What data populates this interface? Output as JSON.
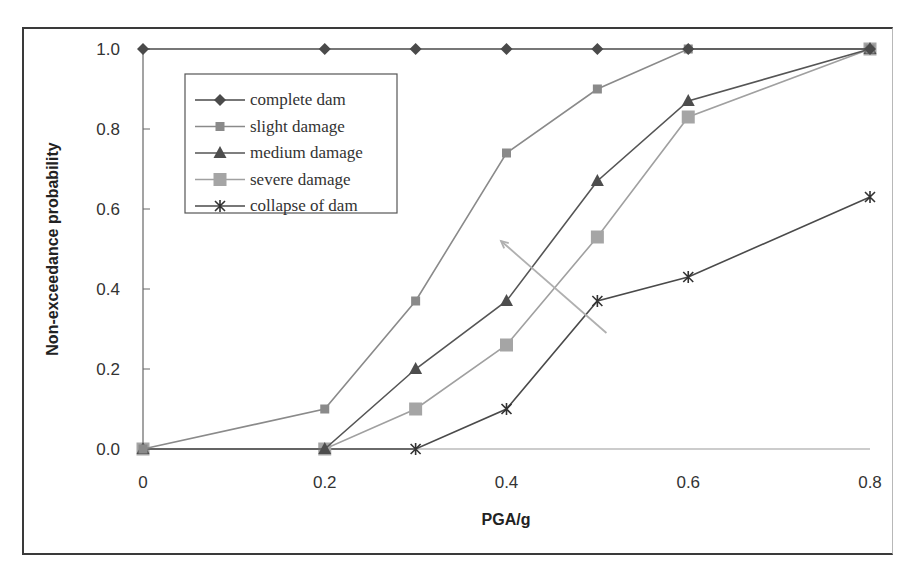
{
  "chart_data": {
    "type": "line",
    "title": "",
    "xlabel": "PGA/g",
    "ylabel": "Non-exceedance probability",
    "x": [
      0.0,
      0.2,
      0.3,
      0.4,
      0.5,
      0.6,
      0.8
    ],
    "xlim": [
      0,
      0.8
    ],
    "ylim": [
      0,
      1.0
    ],
    "xticks": [
      "0",
      "0.2",
      "0.4",
      "0.6",
      "0.8"
    ],
    "xtick_values": [
      0,
      0.2,
      0.4,
      0.6,
      0.8
    ],
    "yticks": [
      "0.0",
      "0.2",
      "0.4",
      "0.6",
      "0.8",
      "1.0"
    ],
    "ytick_values": [
      0,
      0.2,
      0.4,
      0.6,
      0.8,
      1.0
    ],
    "grid": false,
    "legend_position": "upper left (inside)",
    "series": [
      {
        "name": "complete dam",
        "marker": "diamond",
        "color": "#4a4a4a",
        "values": [
          1.0,
          1.0,
          1.0,
          1.0,
          1.0,
          1.0,
          1.0
        ]
      },
      {
        "name": "slight damage",
        "marker": "small-square",
        "color": "#8a8a8a",
        "values": [
          0.0,
          0.1,
          0.37,
          0.74,
          0.9,
          1.0,
          1.0
        ]
      },
      {
        "name": "medium damage",
        "marker": "triangle",
        "color": "#555555",
        "values": [
          0.0,
          0.0,
          0.2,
          0.37,
          0.67,
          0.87,
          1.0
        ]
      },
      {
        "name": "severe damage",
        "marker": "large-square",
        "color": "#a0a0a0",
        "values": [
          0.0,
          0.0,
          0.1,
          0.26,
          0.53,
          0.83,
          1.0
        ]
      },
      {
        "name": "collapse of dam",
        "marker": "asterisk",
        "color": "#4a4a4a",
        "values": [
          0.0,
          0.0,
          0.0,
          0.1,
          0.37,
          0.43,
          0.63
        ]
      }
    ],
    "annotations": [
      {
        "type": "arrow",
        "from": [
          0.51,
          0.29
        ],
        "to": [
          0.394,
          0.52
        ],
        "color": "#b0b0b0",
        "note": "direction of increasing damage state"
      }
    ]
  },
  "axes": {
    "xlabel": "PGA/g",
    "ylabel": "Non-exceedance probability"
  },
  "legend": {
    "items": [
      "complete dam",
      "slight damage",
      "medium damage",
      "severe damage",
      "collapse of dam"
    ]
  }
}
